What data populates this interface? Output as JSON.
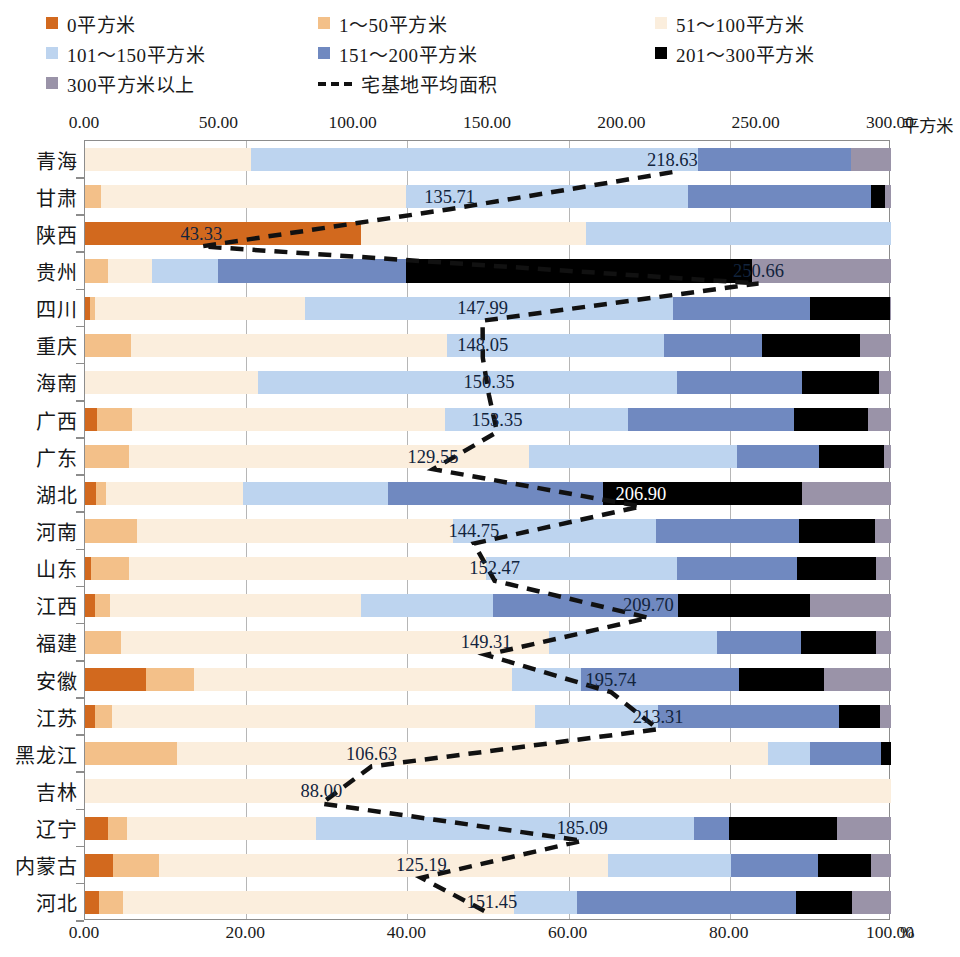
{
  "legend": {
    "items": [
      {
        "label": "0平方米",
        "color": "#d2691e",
        "type": "swatch"
      },
      {
        "label": "1～50平方米",
        "color": "#f3c089",
        "type": "swatch"
      },
      {
        "label": "51～100平方米",
        "color": "#fbeedd",
        "type": "swatch"
      },
      {
        "label": "101～150平方米",
        "color": "#bdd4ef",
        "type": "swatch"
      },
      {
        "label": "151～200平方米",
        "color": "#7089c0",
        "type": "swatch"
      },
      {
        "label": "201～300平方米",
        "color": "#000000",
        "type": "swatch"
      },
      {
        "label": "300平方米以上",
        "color": "#9a93a8",
        "type": "swatch"
      },
      {
        "label": "宅基地平均面积",
        "color": "#111111",
        "type": "dashed-line"
      }
    ]
  },
  "axes": {
    "top": {
      "unit": "平方米",
      "ticks": [
        "0.00",
        "50.00",
        "100.00",
        "150.00",
        "200.00",
        "250.00",
        "300.00"
      ],
      "min": 0,
      "max": 300
    },
    "bottom": {
      "unit": "%",
      "ticks": [
        "0.00",
        "20.00",
        "40.00",
        "60.00",
        "80.00",
        "100.00"
      ],
      "min": 0,
      "max": 100
    }
  },
  "chart_data": {
    "type": "bar",
    "orientation": "horizontal",
    "stacked": true,
    "stack_mode": "percent",
    "title": "",
    "xlabel": "%",
    "ylabel": "",
    "xlim": [
      0,
      100
    ],
    "secondary_axis": {
      "label": "平方米",
      "range": [
        0,
        300
      ],
      "position": "top"
    },
    "grid": true,
    "legend_position": "top",
    "categories": [
      "青海",
      "甘肃",
      "陕西",
      "贵州",
      "四川",
      "重庆",
      "海南",
      "广西",
      "广东",
      "湖北",
      "河南",
      "山东",
      "江西",
      "福建",
      "安徽",
      "江苏",
      "黑龙江",
      "吉林",
      "辽宁",
      "内蒙古",
      "河北"
    ],
    "series": [
      {
        "name": "0平方米",
        "color": "#d2691e",
        "values": [
          0.0,
          0.0,
          34.2,
          0.0,
          0.6,
          0.0,
          0.0,
          1.5,
          0.0,
          1.4,
          0.0,
          0.8,
          1.3,
          0.0,
          7.6,
          1.3,
          0.0,
          0.0,
          2.8,
          3.5,
          1.7
        ]
      },
      {
        "name": "1～50平方米",
        "color": "#f3c089",
        "values": [
          0.0,
          2.0,
          0.0,
          2.9,
          0.7,
          5.7,
          0.0,
          4.3,
          5.5,
          1.2,
          6.4,
          4.6,
          1.8,
          4.5,
          5.9,
          2.1,
          11.4,
          0.0,
          2.4,
          5.7,
          3.0
        ]
      },
      {
        "name": "51～100平方米",
        "color": "#fbeedd",
        "values": [
          20.6,
          37.8,
          27.9,
          5.4,
          26.0,
          39.2,
          21.5,
          38.9,
          49.6,
          17.0,
          39.3,
          44.3,
          31.2,
          53.1,
          39.5,
          52.4,
          73.3,
          100.0,
          23.4,
          55.7,
          48.5
        ]
      },
      {
        "name": "101～150平方米",
        "color": "#bdd4ef",
        "values": [
          55.4,
          35.0,
          37.9,
          8.2,
          45.7,
          27.0,
          51.9,
          22.7,
          25.8,
          18.0,
          25.2,
          23.8,
          16.3,
          20.8,
          8.6,
          15.3,
          5.2,
          0.0,
          46.9,
          15.2,
          7.8
        ]
      },
      {
        "name": "151～200平方米",
        "color": "#7089c0",
        "values": [
          19.0,
          22.7,
          0.0,
          23.3,
          16.9,
          12.1,
          15.6,
          20.6,
          10.2,
          26.7,
          17.7,
          14.9,
          23.0,
          10.4,
          19.6,
          22.5,
          8.8,
          0.0,
          4.4,
          10.9,
          27.2
        ]
      },
      {
        "name": "201～300平方米",
        "color": "#000000",
        "values": [
          0.0,
          1.7,
          0.0,
          43.0,
          10.0,
          12.1,
          9.5,
          9.1,
          8.0,
          24.6,
          9.4,
          9.7,
          16.4,
          9.3,
          10.5,
          5.1,
          1.3,
          0.0,
          13.4,
          6.5,
          7.0
        ]
      },
      {
        "name": "300平方米以上",
        "color": "#9a93a8",
        "values": [
          5.0,
          0.8,
          0.0,
          17.2,
          0.1,
          3.9,
          1.5,
          2.9,
          0.9,
          11.1,
          2.0,
          1.9,
          10.0,
          1.9,
          8.3,
          1.3,
          0.0,
          0.0,
          6.7,
          2.5,
          4.8
        ]
      }
    ],
    "line_series": {
      "name": "宅基地平均面积",
      "color": "#111111",
      "style": "dashed",
      "unit": "平方米",
      "values": [
        218.63,
        135.71,
        43.33,
        250.66,
        147.99,
        148.05,
        150.35,
        153.35,
        129.55,
        206.9,
        144.75,
        152.47,
        209.7,
        149.31,
        195.74,
        213.31,
        106.63,
        88.0,
        185.09,
        125.19,
        151.45
      ],
      "labels": [
        "218.63",
        "135.71",
        "43.33",
        "250.66",
        "147.99",
        "148.05",
        "150.35",
        "153.35",
        "129.55",
        "206.90",
        "144.75",
        "152.47",
        "209.70",
        "149.31",
        "195.74",
        "213.31",
        "106.63",
        "88.00",
        "185.09",
        "125.19",
        "151.45"
      ]
    }
  }
}
